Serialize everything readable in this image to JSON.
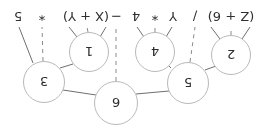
{
  "diagram": {
    "kind": "expression-parse-tree",
    "orientation_degrees": 180,
    "canvas": {
      "width": 266,
      "height": 128
    },
    "style": {
      "background": "#ffffff",
      "node_fill": "#ffffff",
      "node_stroke": "#b9b9b9",
      "solid_edge_color": "#6e6e6e",
      "dashed_edge_color": "#8a8a8a",
      "text_color": "#2b2b2b"
    },
    "nodes": [
      {
        "id": "n6",
        "label": "6",
        "x": 150,
        "y": 25,
        "r": 22
      },
      {
        "id": "n5",
        "label": "5",
        "x": 78,
        "y": 45,
        "r": 21
      },
      {
        "id": "n3",
        "label": "3",
        "x": 222,
        "y": 46,
        "r": 21
      },
      {
        "id": "n2",
        "label": "2",
        "x": 35,
        "y": 73,
        "r": 20
      },
      {
        "id": "n4",
        "label": "4",
        "x": 111,
        "y": 76,
        "r": 20
      },
      {
        "id": "n1",
        "label": "1",
        "x": 177,
        "y": 76,
        "r": 20
      }
    ],
    "leaves": [
      {
        "id": "l1",
        "label": "(Z + 6)",
        "x": 35,
        "y": 112
      },
      {
        "id": "l2",
        "label": "/",
        "x": 71,
        "y": 112
      },
      {
        "id": "l3",
        "label": "Y",
        "x": 93,
        "y": 112
      },
      {
        "id": "l4",
        "label": "*",
        "x": 111,
        "y": 112
      },
      {
        "id": "l5",
        "label": "4",
        "x": 130,
        "y": 112
      },
      {
        "id": "l6",
        "label": "−",
        "x": 150,
        "y": 112
      },
      {
        "id": "l7",
        "label": "(X + Y)",
        "x": 180,
        "y": 112
      },
      {
        "id": "l8",
        "label": "*",
        "x": 224,
        "y": 112
      },
      {
        "id": "l9",
        "label": "5",
        "x": 248,
        "y": 112
      }
    ],
    "edges": [
      {
        "from": "n6",
        "to": "n5",
        "style": "solid"
      },
      {
        "from": "n6",
        "to": "n3",
        "style": "solid"
      },
      {
        "from": "n6",
        "to": "l6",
        "style": "dashed"
      },
      {
        "from": "n5",
        "to": "n2",
        "style": "solid"
      },
      {
        "from": "n5",
        "to": "l2",
        "style": "dashed"
      },
      {
        "from": "n5",
        "to": "n4",
        "style": "solid"
      },
      {
        "from": "n2",
        "to": "l1a",
        "style": "solid"
      },
      {
        "from": "n2",
        "to": "l1b",
        "style": "dashed"
      },
      {
        "from": "n2",
        "to": "l1c",
        "style": "solid"
      },
      {
        "from": "n4",
        "to": "l3",
        "style": "solid"
      },
      {
        "from": "n4",
        "to": "l4",
        "style": "dashed"
      },
      {
        "from": "n4",
        "to": "l5",
        "style": "solid"
      },
      {
        "from": "n3",
        "to": "n1",
        "style": "solid"
      },
      {
        "from": "n3",
        "to": "l8",
        "style": "dashed"
      },
      {
        "from": "n3",
        "to": "l9",
        "style": "solid"
      },
      {
        "from": "n1",
        "to": "l7a",
        "style": "solid"
      },
      {
        "from": "n1",
        "to": "l7b",
        "style": "dashed"
      },
      {
        "from": "n1",
        "to": "l7c",
        "style": "solid"
      }
    ]
  }
}
